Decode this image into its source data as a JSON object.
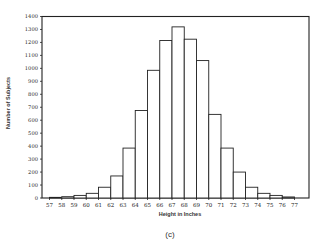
{
  "chart_data": {
    "type": "bar",
    "subtype": "histogram",
    "title": "",
    "caption": "(c)",
    "xlabel": "Height in Inches",
    "ylabel": "Number of Subjects",
    "x_tick_labels": [
      "57",
      "58",
      "59",
      "60",
      "61",
      "62",
      "63",
      "64",
      "65",
      "66",
      "67",
      "68",
      "69",
      "70",
      "71",
      "72",
      "73",
      "74",
      "75",
      "76",
      "77"
    ],
    "y_ticks": [
      0,
      100,
      200,
      300,
      400,
      500,
      600,
      700,
      800,
      900,
      1000,
      1100,
      1200,
      1300,
      1400
    ],
    "ylim": [
      0,
      1400
    ],
    "bins": [
      "57-58",
      "58-59",
      "59-60",
      "60-61",
      "61-62",
      "62-63",
      "63-64",
      "64-65",
      "65-66",
      "66-67",
      "67-68",
      "68-69",
      "69-70",
      "70-71",
      "71-72",
      "72-73",
      "73-74",
      "74-75",
      "75-76",
      "76-77"
    ],
    "values": [
      5,
      10,
      20,
      36,
      83,
      170,
      385,
      675,
      985,
      1215,
      1320,
      1225,
      1060,
      645,
      385,
      200,
      83,
      36,
      20,
      8
    ],
    "grid": false,
    "legend": null,
    "colors": {
      "bar_fill": "#ffffff",
      "bar_stroke": "#222222",
      "axis": "#222222"
    }
  }
}
